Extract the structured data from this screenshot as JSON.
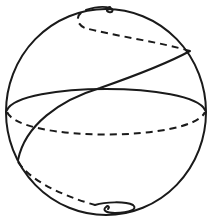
{
  "figure": {
    "title": "Loxodrome spiraling on a sphere",
    "elements": [
      {
        "name": "sphere-outline",
        "style": "solid"
      },
      {
        "name": "equator-front",
        "style": "solid"
      },
      {
        "name": "equator-back",
        "style": "dashed"
      },
      {
        "name": "loxodrome-front",
        "style": "solid"
      },
      {
        "name": "loxodrome-back-upper",
        "style": "dashed"
      },
      {
        "name": "loxodrome-back-lower",
        "style": "dashed"
      },
      {
        "name": "north-pole-coil",
        "style": "solid"
      },
      {
        "name": "south-pole-coil",
        "style": "solid"
      }
    ],
    "colors": {
      "stroke": "#1a1a1a",
      "background": "#ffffff"
    }
  }
}
